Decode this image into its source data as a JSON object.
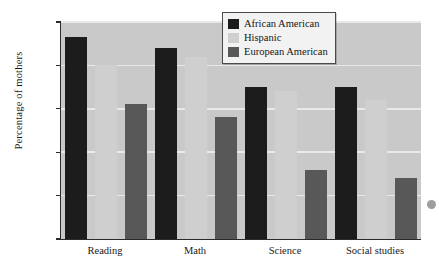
{
  "chart_data": {
    "type": "bar",
    "title": "",
    "xlabel": "",
    "ylabel": "Percentage of mothers",
    "categories": [
      "Reading",
      "Math",
      "Science",
      "Social studies"
    ],
    "series": [
      {
        "name": "African American",
        "color": "#1c1c1c",
        "values": [
          93,
          88,
          70,
          70
        ]
      },
      {
        "name": "Hispanic",
        "color": "#cfcfcf",
        "values": [
          80,
          84,
          68,
          64
        ]
      },
      {
        "name": "European American",
        "color": "#585858",
        "values": [
          62,
          56,
          32,
          28
        ]
      }
    ],
    "ylim": [
      0,
      100
    ],
    "yticks": [
      0,
      20,
      40,
      60,
      80,
      100
    ],
    "ytick_labels": [
      "0",
      "20",
      "40",
      "60",
      "80",
      "100"
    ],
    "grid": true,
    "legend_position": "top-right",
    "plot_background": "#c9c9c9"
  }
}
